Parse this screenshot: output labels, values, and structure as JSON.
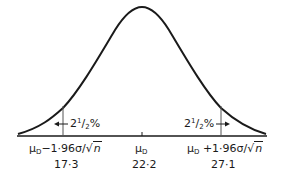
{
  "diagram": {
    "type": "normal_distribution",
    "colors": {
      "curve": "#1a1a1a",
      "axis": "#1a1a1a",
      "marker": "#555555"
    },
    "tails": {
      "left_label": "2",
      "left_sup": "1",
      "left_den": "2",
      "left_pct": "%",
      "right_label": "2",
      "right_sup": "1",
      "right_den": "2",
      "right_pct": "%"
    },
    "axis_labels": {
      "left": {
        "mu": "μ",
        "sub": "D",
        "text": "−1·96σ/",
        "root": "n",
        "value": "17·3"
      },
      "center": {
        "mu": "μ",
        "sub": "D",
        "value": "22·2"
      },
      "right": {
        "mu": "μ",
        "sub": "D",
        "text": " +1·96σ/",
        "root": "n",
        "value": "27·1"
      }
    }
  }
}
